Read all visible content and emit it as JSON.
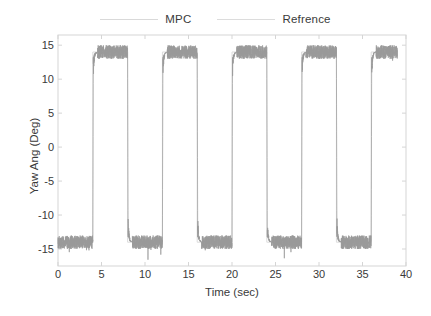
{
  "figure": {
    "axis_box": {
      "left": 58,
      "top": 35,
      "right": 406,
      "bottom": 266
    },
    "line_color": "#9a9a9a",
    "axis_color": "#d5d5d5",
    "text_color": "#3a3a3a"
  },
  "legend": {
    "position": "top-center-outside",
    "entries": [
      {
        "label": "MPC",
        "sample": "line",
        "color": "#d9d9d9"
      },
      {
        "label": "Refrence",
        "sample": "line",
        "color": "#dcdcdc"
      }
    ]
  },
  "chart_data": {
    "type": "line",
    "title": "",
    "subtitle": "",
    "xlabel": "Time (sec)",
    "ylabel": "Yaw Ang (Deg)",
    "xlim": [
      0,
      40
    ],
    "ylim": [
      -17.5,
      16.5
    ],
    "xticks": [
      0,
      5,
      10,
      15,
      20,
      25,
      30,
      35,
      40
    ],
    "yticks": [
      15,
      10,
      5,
      0,
      -5,
      -10,
      -15
    ],
    "xticklabels": [
      "0",
      "5",
      "10",
      "15",
      "20",
      "25",
      "30",
      "35",
      "40"
    ],
    "yticklabels": [
      "15",
      "10",
      "5",
      "0",
      "-5",
      "-10",
      "-15"
    ],
    "grid": false,
    "box": true,
    "legend_position": "top-center",
    "waveform": {
      "description": "square wave, reference tracked by noisy MPC response",
      "period_sec": 8,
      "high_level_deg": 14,
      "low_level_deg": -14,
      "noise_amplitude_deg": 1.0,
      "t_start": 0,
      "t_end": 39,
      "first_transition_sec": 4,
      "transition_times_sec": [
        4,
        8,
        12,
        16,
        20,
        24,
        28,
        32,
        36
      ],
      "sample_rate_hz": 120,
      "overshoot_spikes_deg": 3.5
    },
    "series": [
      {
        "name": "MPC",
        "color": "#9a9a9a",
        "style": "noisy-square",
        "values_summary": "±14 deg square wave with ~±1 deg measurement noise on plateaus and transient spikes at each edge"
      },
      {
        "name": "Refrence",
        "color": "#dcdcdc",
        "style": "square",
        "values_summary": "ideal ±14 deg square wave, 8 s period, first edge at t = 4 s"
      }
    ],
    "segments": [
      {
        "t0": 0,
        "t1": 4,
        "level": -14
      },
      {
        "t0": 4,
        "t1": 8,
        "level": 14
      },
      {
        "t0": 8,
        "t1": 12,
        "level": -14
      },
      {
        "t0": 12,
        "t1": 16,
        "level": 14
      },
      {
        "t0": 16,
        "t1": 20,
        "level": -14
      },
      {
        "t0": 20,
        "t1": 24,
        "level": 14
      },
      {
        "t0": 24,
        "t1": 28,
        "level": -14
      },
      {
        "t0": 28,
        "t1": 32,
        "level": 14
      },
      {
        "t0": 32,
        "t1": 36,
        "level": -14
      },
      {
        "t0": 36,
        "t1": 39,
        "level": 14
      }
    ]
  }
}
